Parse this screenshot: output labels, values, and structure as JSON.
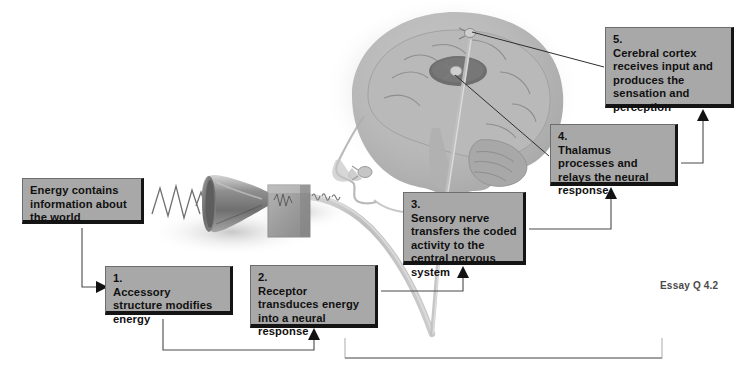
{
  "figure": {
    "essay_label": "Essay Q 4.2",
    "colors": {
      "box_fill": "#a8a8a8",
      "box_shadow": "#141414",
      "text": "#101010",
      "connector": "#4a4a4a",
      "label_text": "#4a4a4a",
      "background": "#ffffff"
    }
  },
  "boxes": [
    {
      "id": "energy",
      "number": "",
      "text": "Energy contains information about the world",
      "x": 22,
      "y": 178,
      "w": 122,
      "h": 46
    },
    {
      "id": "accessory",
      "number": "1.",
      "text": "Accessory structure modifies energy",
      "x": 105,
      "y": 266,
      "w": 128,
      "h": 49
    },
    {
      "id": "receptor",
      "number": "2.",
      "text": "Receptor transduces energy into a neural response",
      "x": 250,
      "y": 265,
      "w": 128,
      "h": 63
    },
    {
      "id": "sensory-nerve",
      "number": "3.",
      "text": "Sensory nerve transfers the coded activity to the central nervous system",
      "x": 403,
      "y": 192,
      "w": 123,
      "h": 73
    },
    {
      "id": "thalamus",
      "number": "4.",
      "text": "Thalamus processes and relays the neural response",
      "x": 550,
      "y": 124,
      "w": 128,
      "h": 62
    },
    {
      "id": "cerebral-cortex",
      "number": "5.",
      "text": "Cerebral cortex receives input and produces the sensation and perception",
      "x": 605,
      "y": 27,
      "w": 129,
      "h": 81
    }
  ],
  "illustrations": [
    {
      "id": "sound-waves",
      "label": "sound wave lines entering horn"
    },
    {
      "id": "horn",
      "label": "funnel / horn accessory structure"
    },
    {
      "id": "receptor-block",
      "label": "gray receptor block"
    },
    {
      "id": "nerve-pathway",
      "label": "sensory nerve running to the brain"
    },
    {
      "id": "head-brain",
      "label": "grayscale side view of head and brain"
    },
    {
      "id": "thalamus-ellipse",
      "label": "dark thalamus ellipse inside brain"
    }
  ]
}
